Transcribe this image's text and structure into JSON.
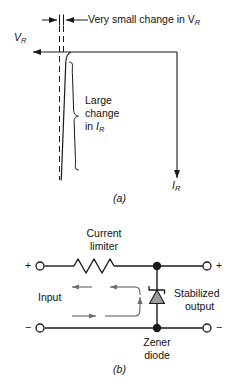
{
  "figure": {
    "panels": [
      {
        "id": "a",
        "label": "(a)",
        "type": "zener-characteristic-curve",
        "annotations": {
          "top_dimension": "Very small change in V",
          "top_dimension_sub": "R",
          "vertical_axis_label": "V",
          "vertical_axis_sub": "R",
          "current_axis_label": "I",
          "current_axis_sub": "R",
          "brace_line1": "Large",
          "brace_line2": "change",
          "brace_line3_prefix": "in ",
          "brace_line3_var": "I",
          "brace_line3_sub": "R"
        }
      },
      {
        "id": "b",
        "label": "(b)",
        "type": "zener-regulator-circuit",
        "annotations": {
          "resistor_label_line1": "Current",
          "resistor_label_line2": "limiter",
          "input_label": "Input",
          "output_label_line1": "Stabilized",
          "output_label_line2": "output",
          "diode_label_line1": "Zener",
          "diode_label_line2": "diode",
          "terminal_in_plus": "+",
          "terminal_in_minus": "−",
          "terminal_out_plus": "+",
          "terminal_out_minus": "−"
        }
      }
    ]
  },
  "colors": {
    "line": "#1a1a1a",
    "arrow_gray": "#6e6e6e",
    "diode_fill": "#9a9a9a",
    "background": "#ffffff",
    "text": "#111111"
  }
}
